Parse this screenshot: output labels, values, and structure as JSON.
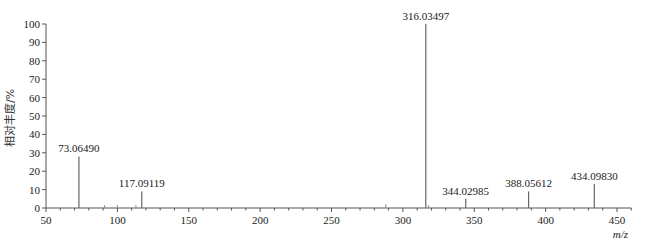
{
  "chart_data": {
    "type": "bar",
    "subtype": "mass-spectrum-stick",
    "title": "",
    "xlabel": "m/z",
    "ylabel": "相对丰度/%",
    "xlim": [
      50,
      460
    ],
    "ylim": [
      0,
      100
    ],
    "x_ticks": [
      50,
      100,
      150,
      200,
      250,
      300,
      350,
      400,
      450
    ],
    "y_ticks": [
      0,
      10,
      20,
      30,
      40,
      50,
      60,
      70,
      80,
      90,
      100
    ],
    "grid": false,
    "legend": null,
    "peaks": [
      {
        "mz": 73.0649,
        "intensity": 28,
        "label": "73.06490"
      },
      {
        "mz": 117.09119,
        "intensity": 9,
        "label": "117.09119"
      },
      {
        "mz": 316.03497,
        "intensity": 100,
        "label": "316.03497"
      },
      {
        "mz": 344.02985,
        "intensity": 5,
        "label": "344.02985"
      },
      {
        "mz": 388.05612,
        "intensity": 9,
        "label": "388.05612"
      },
      {
        "mz": 434.0983,
        "intensity": 13,
        "label": "434.09830"
      }
    ],
    "minor_peaks": [
      {
        "mz": 91,
        "intensity": 1
      },
      {
        "mz": 100,
        "intensity": 1
      },
      {
        "mz": 113,
        "intensity": 1
      },
      {
        "mz": 288,
        "intensity": 1.5
      },
      {
        "mz": 318,
        "intensity": 1
      }
    ]
  }
}
